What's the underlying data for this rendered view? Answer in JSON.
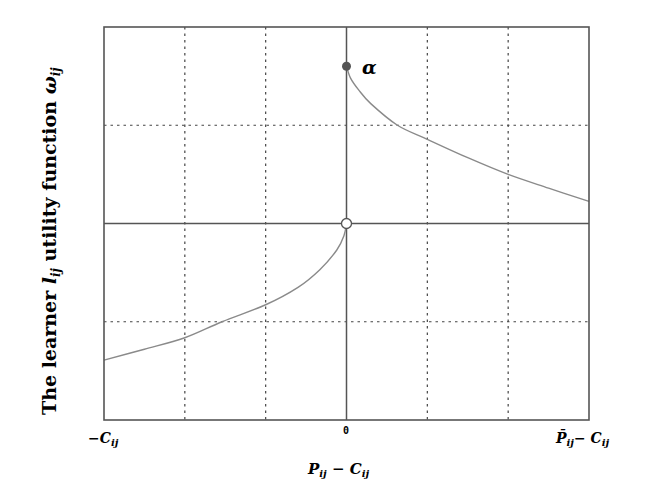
{
  "chart_data": {
    "type": "line",
    "title": "",
    "xlabel": "P_ij − C_ij",
    "ylabel": "The learner l_ij utility function ω_ij",
    "xlim": [
      -3,
      3
    ],
    "ylim": [
      -2,
      2
    ],
    "grid": true,
    "grid_style": "dotted",
    "x_ticks": [
      {
        "value": -3,
        "label": "−C_ij"
      },
      {
        "value": 0,
        "label": "0"
      },
      {
        "value": 3,
        "label": "P̄_ij − C_ij"
      }
    ],
    "x_gridlines": [
      -2,
      -1,
      1,
      2
    ],
    "y_gridlines": [
      -1,
      1
    ],
    "axis_lines": {
      "x0": 0,
      "y0": 0
    },
    "series": [
      {
        "name": "gain branch (P_ij − C_ij ≥ 0)",
        "x": [
          0,
          0.05,
          0.15,
          0.3,
          0.63,
          1,
          1.5,
          2,
          2.5,
          3
        ],
        "values": [
          1.6,
          1.48,
          1.36,
          1.22,
          1.0,
          0.857,
          0.67,
          0.5,
          0.36,
          0.225
        ]
      },
      {
        "name": "loss branch (P_ij − C_ij < 0)",
        "x": [
          -3,
          -2.5,
          -2,
          -1.54,
          -1,
          -0.6,
          -0.33,
          -0.12,
          -0.03,
          0
        ],
        "values": [
          -1.39,
          -1.28,
          -1.163,
          -1.0,
          -0.827,
          -0.65,
          -0.47,
          -0.27,
          -0.12,
          0
        ]
      }
    ],
    "annotations": [
      {
        "type": "filled-point",
        "x": 0,
        "y": 1.6,
        "label": "α"
      },
      {
        "type": "open-point",
        "x": 0,
        "y": 0,
        "label": ""
      }
    ],
    "colors": {
      "frame": "#555555",
      "grid": "#444444",
      "curve": "#8a8a8a",
      "filled_point": "#555555",
      "open_point_fill": "#ffffff"
    }
  },
  "labels": {
    "alpha": "α",
    "x_axis_title_main": "P",
    "x_axis_title_sub": "ij",
    "x_axis_title_minus": " − C",
    "x_axis_title_sub2": "ij",
    "tick_left_main": "−C",
    "tick_left_sub": "ij",
    "tick_zero": "0",
    "tick_right_main": "P̄",
    "tick_right_sub": "ij",
    "tick_right_minus": "− C",
    "tick_right_sub2": "ij",
    "y_axis_prefix": "The learner ",
    "y_axis_l": "l",
    "y_axis_l_sub": "ij",
    "y_axis_mid": " utility function ",
    "y_axis_omega": "ω",
    "y_axis_omega_sub": "ij"
  }
}
